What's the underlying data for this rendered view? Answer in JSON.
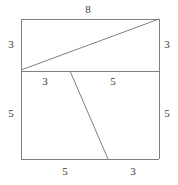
{
  "figure": {
    "type": "geometry-diagram",
    "colors": {
      "stroke": "#808080",
      "text": "#3a3a3a",
      "background": "#ffffff"
    },
    "square": {
      "left": 21,
      "top": 19,
      "right": 159,
      "bottom": 159
    },
    "segments": [
      {
        "name": "square-top-edge",
        "x1": 21,
        "y1": 19,
        "x2": 159,
        "y2": 19
      },
      {
        "name": "square-right-edge",
        "x1": 159,
        "y1": 19,
        "x2": 159,
        "y2": 159
      },
      {
        "name": "square-bottom-edge",
        "x1": 159,
        "y1": 159,
        "x2": 21,
        "y2": 159
      },
      {
        "name": "square-left-edge",
        "x1": 21,
        "y1": 159,
        "x2": 21,
        "y2": 19
      },
      {
        "name": "middle-horizontal-line",
        "x1": 21,
        "y1": 71,
        "x2": 159,
        "y2": 71
      },
      {
        "name": "upper-diagonal-line",
        "x1": 21,
        "y1": 70,
        "x2": 159,
        "y2": 19
      },
      {
        "name": "lower-slant-line",
        "x1": 70,
        "y1": 71,
        "x2": 108,
        "y2": 159
      }
    ],
    "labels": [
      {
        "name": "label-top-width",
        "text": "8",
        "x": 88,
        "y": 10
      },
      {
        "name": "label-left-upper-height",
        "text": "3",
        "x": 11,
        "y": 45
      },
      {
        "name": "label-right-upper-height",
        "text": "3",
        "x": 167,
        "y": 45
      },
      {
        "name": "label-left-lower-height",
        "text": "5",
        "x": 11,
        "y": 114
      },
      {
        "name": "label-right-lower-height",
        "text": "5",
        "x": 167,
        "y": 114
      },
      {
        "name": "label-mid-left-segment",
        "text": "3",
        "x": 45,
        "y": 82
      },
      {
        "name": "label-mid-right-segment",
        "text": "5",
        "x": 113,
        "y": 82
      },
      {
        "name": "label-bottom-left-segment",
        "text": "5",
        "x": 65,
        "y": 172
      },
      {
        "name": "label-bottom-right-segment",
        "text": "3",
        "x": 133,
        "y": 172
      }
    ]
  }
}
